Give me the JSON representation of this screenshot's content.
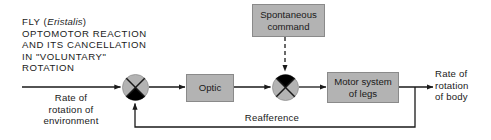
{
  "diagram": {
    "title": {
      "lines": [
        "FLY (Eristalis)",
        "OPTOMOTOR REACTION",
        "AND ITS CANCELLATION",
        "IN \"VOLUNTARY\"",
        "ROTATION"
      ],
      "species": "Eristalis",
      "line1_prefix": "FLY (",
      "line1_suffix": ")",
      "line2": "OPTOMOTOR REACTION",
      "line3": "AND ITS CANCELLATION",
      "line4": "IN \"VOLUNTARY\"",
      "line5": "ROTATION"
    },
    "input": {
      "label_line1": "Rate of",
      "label_line2": "rotation of",
      "label_line3": "environment"
    },
    "output": {
      "label_line1": "Rate of",
      "label_line2": "rotation",
      "label_line3": "of body"
    },
    "blocks": {
      "spontaneous_command": {
        "line1": "Spontaneous",
        "line2": "command"
      },
      "optic": {
        "label": "Optic"
      },
      "motor_system": {
        "line1": "Motor system",
        "line2": "of legs"
      }
    },
    "feedback": {
      "label": "Reafference"
    },
    "junctions": [
      {
        "name": "comparator-1",
        "filled_quadrant": "bottom"
      },
      {
        "name": "comparator-2",
        "filled_quadrant": "top"
      }
    ],
    "colors": {
      "box_fill": "#b3b3b3",
      "box_border": "#8a8a8a",
      "junction_fill": "#b3b3b3",
      "junction_accent": "#000000",
      "line": "#1a1a1a",
      "text": "#1a1a1a",
      "background": "#ffffff"
    }
  }
}
